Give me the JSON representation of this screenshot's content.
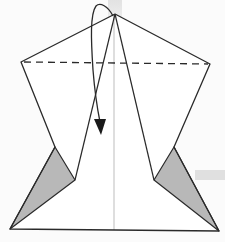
{
  "diagram": {
    "type": "origami-fold-step",
    "colors": {
      "line": "#2a2a2a",
      "paper": "#ffffff",
      "shade": "#b8b8b8",
      "centerline": "#bdbdbd",
      "background": "#fbfbfb"
    },
    "elements": {
      "apex": [
        115,
        14
      ],
      "left_corner": [
        21,
        62
      ],
      "right_corner": [
        210,
        64
      ],
      "dashed_fold_line": {
        "from": [
          21,
          62
        ],
        "to": [
          210,
          64
        ],
        "style": "dashed"
      },
      "left_notch": {
        "upper": [
          55,
          147
        ],
        "inner": [
          75,
          180
        ]
      },
      "right_notch": {
        "upper": [
          174,
          147
        ],
        "inner": [
          154,
          180
        ]
      },
      "bottom_left": [
        10,
        229
      ],
      "bottom_right": [
        219,
        231
      ],
      "center_line_x": 114,
      "arrow": {
        "label": "fold-down-arrow",
        "start": [
          113,
          16
        ],
        "end": [
          101,
          133
        ]
      }
    }
  }
}
